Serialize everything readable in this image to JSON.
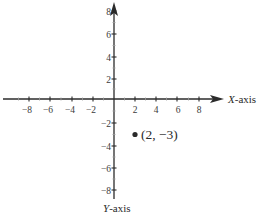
{
  "diagram": {
    "type": "coordinate-plane",
    "x_axis": {
      "label_italic": "X",
      "label_suffix": "-axis",
      "range": [
        -9,
        10
      ],
      "tick_labels": [
        "−8",
        "−6",
        "−4",
        "−2",
        "2",
        "4",
        "6",
        "8"
      ],
      "tick_values": [
        -8,
        -6,
        -4,
        -2,
        2,
        4,
        6,
        8
      ]
    },
    "y_axis": {
      "label_italic": "Y",
      "label_suffix": "-axis",
      "range": [
        -8.5,
        9
      ],
      "tick_labels": [
        "8",
        "6",
        "4",
        "2",
        "−2",
        "−4",
        "−6",
        "−8"
      ],
      "tick_values": [
        8,
        6,
        4,
        2,
        -2,
        -4,
        -6,
        -8
      ]
    },
    "point": {
      "x": 2,
      "y": -3,
      "label": "(2, −3)"
    },
    "colors": {
      "axis": "#2b2b2b",
      "text": "#3a3a3a",
      "point": "#2b2b2b"
    }
  }
}
